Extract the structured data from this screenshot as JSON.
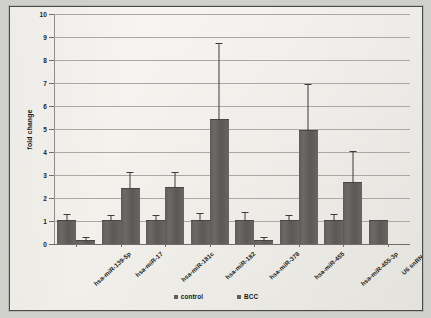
{
  "chart_data": {
    "type": "bar",
    "title": "",
    "xlabel": "",
    "ylabel": "fold change",
    "ylim": [
      0,
      10
    ],
    "yticks": [
      0,
      1,
      2,
      3,
      4,
      5,
      6,
      7,
      8,
      9,
      10
    ],
    "ytick_labels": [
      "0",
      "1",
      "2",
      "3",
      "4",
      "5",
      "6",
      "7",
      "8",
      "9",
      "10"
    ],
    "grid": true,
    "legend_position": "bottom",
    "categories": [
      "hsa-miR-139-5p",
      "hsa-miR-17",
      "hsa-miR-181c",
      "hsa-miR-182",
      "hsa-miR-378",
      "hsa-miR-455",
      "hsa-miR-455-3p",
      "U6 snRNA"
    ],
    "series": [
      {
        "name": "control",
        "color": "#5f5e5c",
        "values": [
          1.0,
          1.0,
          1.0,
          1.0,
          1.0,
          1.0,
          1.0,
          1.0
        ],
        "errors_upper": [
          1.25,
          1.2,
          1.2,
          1.3,
          1.35,
          1.2,
          1.25,
          null
        ]
      },
      {
        "name": "BCC",
        "color": "#5f5e5c",
        "values": [
          0.15,
          2.4,
          2.45,
          5.4,
          0.15,
          4.9,
          2.65,
          null
        ],
        "errors_upper": [
          0.25,
          3.1,
          3.1,
          8.7,
          0.25,
          6.9,
          4.0,
          null
        ]
      }
    ]
  },
  "legend": {
    "items": [
      {
        "label": "control"
      },
      {
        "label": "BCC"
      }
    ]
  },
  "colors": {
    "bar": "#5f5e5c",
    "grid": "#a9a8a4",
    "axis": "#6f6e6b",
    "paper": "#f4f3ef",
    "frame": "#4a4a48"
  }
}
